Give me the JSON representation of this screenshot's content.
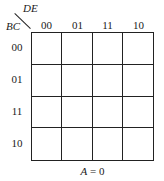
{
  "kmap": {
    "column_variable": "DE",
    "row_variable": "BC",
    "column_labels": [
      "00",
      "01",
      "11",
      "10"
    ],
    "row_labels": [
      "00",
      "01",
      "11",
      "10"
    ],
    "cells": [
      [
        "",
        "",
        "",
        ""
      ],
      [
        "",
        "",
        "",
        ""
      ],
      [
        "",
        "",
        "",
        ""
      ],
      [
        "",
        "",
        "",
        ""
      ]
    ],
    "caption_var": "A",
    "caption_rest": " = 0"
  }
}
